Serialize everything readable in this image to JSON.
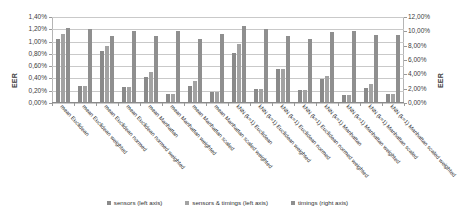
{
  "chart_data": {
    "type": "bar",
    "title": "",
    "xlabel": "",
    "ylabel": "EER",
    "ylabel_right": "EER",
    "grid": true,
    "legend_position": "bottom",
    "ylim": [
      0,
      1.4
    ],
    "ylim_right": [
      0,
      12
    ],
    "ytick_labels": [
      "0,00%",
      "0,20%",
      "0,40%",
      "0,60%",
      "0,80%",
      "1,00%",
      "1,20%",
      "1,40%"
    ],
    "ytick_values": [
      0,
      0.2,
      0.4,
      0.6,
      0.8,
      1.0,
      1.2,
      1.4
    ],
    "ytick_labels_right": [
      "0,00%",
      "2,00%",
      "4,00%",
      "6,00%",
      "8,00%",
      "10,00%",
      "12,00%"
    ],
    "ytick_values_right": [
      0,
      2,
      4,
      6,
      8,
      10,
      12
    ],
    "categories": [
      "mean Euclidean",
      "mean Euclidean weighted",
      "mean Euclidean normed",
      "mean Euclidean normed weighted",
      "mean Manhattan",
      "mean Manhattan weighted",
      "mean Manhattan scaled",
      "mean Manhattan scaled weighted",
      "kNN (k=1) Euclidean",
      "kNN (k=1) Euclidean weighted",
      "kNN (k=1) Euclidean normed",
      "kNN (k=1) Euclidean normed weighted",
      "kNN (k=1) Manhattan",
      "kNN (k=1) Manhattan weighted",
      "kNN (k=1) Manhattan scaled",
      "kNN (k=1) Manhattan scaled weighted"
    ],
    "series": [
      {
        "name": "sensors (left axis)",
        "axis": "left",
        "color": "#8a8a8a",
        "values": [
          1.04,
          0.27,
          0.85,
          0.26,
          0.42,
          0.15,
          0.28,
          0.18,
          0.82,
          0.23,
          0.56,
          0.22,
          0.39,
          0.13,
          0.25,
          0.14
        ]
      },
      {
        "name": "sensors & timings (left axis)",
        "axis": "left",
        "color": "#a3a3a3",
        "values": [
          1.12,
          0.27,
          0.93,
          0.26,
          0.51,
          0.15,
          0.36,
          0.18,
          0.96,
          0.23,
          0.56,
          0.22,
          0.44,
          0.13,
          0.31,
          0.14
        ]
      },
      {
        "name": "timings (right axis)",
        "axis": "right",
        "color": "#8f8f8f",
        "values": [
          10.5,
          10.3,
          9.3,
          10.0,
          9.3,
          10.0,
          8.9,
          9.6,
          10.7,
          10.3,
          9.3,
          9.0,
          9.9,
          10.0,
          9.5,
          9.5
        ]
      }
    ]
  },
  "legend": {
    "items": [
      {
        "label": "sensors (left axis)"
      },
      {
        "label": "sensors & timings (left axis)"
      },
      {
        "label": "timings (right axis)"
      }
    ]
  },
  "axes": {
    "left_title": "EER",
    "right_title": "EER"
  }
}
